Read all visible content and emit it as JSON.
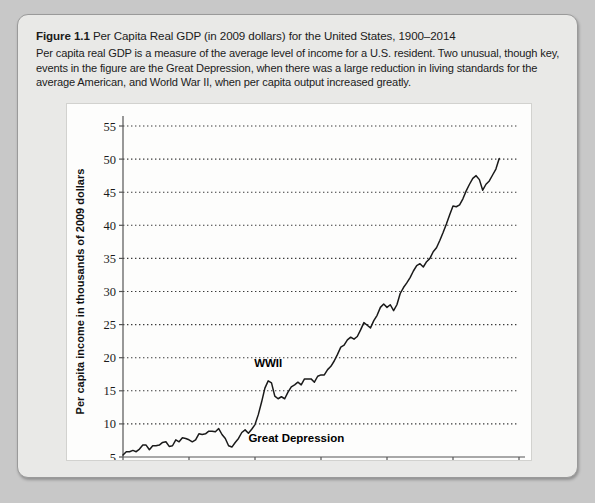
{
  "figure": {
    "label": "Figure 1.1",
    "title": "Per Capita Real GDP (in 2009 dollars) for the United States, 1900–2014",
    "description": "Per capita real GDP is a measure of the average level of income for a U.S. resident. Two unusual, though key, events in the figure are the Great Depression, when there was a large reduction in living standards for the average American, and World War II, when per capita output increased greatly."
  },
  "colors": {
    "page_background": "#c8c8c8",
    "panel_background": "#e9e9e7",
    "panel_border": "#9a9a9a",
    "plot_background": "#fdfdfc",
    "line": "#1a1a1a",
    "gridline": "#3a3a3a",
    "axis": "#555555"
  },
  "chart_data": {
    "type": "line",
    "title": "Per Capita Real GDP (in 2009 dollars) for the United States, 1900–2014",
    "xlabel": "Year",
    "ylabel": "Per capita income in thousands of 2009 dollars",
    "xlim": [
      1900,
      2020
    ],
    "ylim": [
      5,
      55
    ],
    "xticks": [
      1900,
      1920,
      1940,
      1960,
      1980,
      2000,
      2020
    ],
    "yticks": [
      5,
      10,
      15,
      20,
      25,
      30,
      35,
      40,
      45,
      50,
      55
    ],
    "grid": "horizontal-dotted",
    "legend": "none",
    "annotations": [
      {
        "text": "WWII",
        "x": 1944,
        "y": 18.6
      },
      {
        "text": "Great Depression",
        "x": 1938,
        "y": 7.2
      }
    ],
    "series": [
      {
        "name": "Per capita real GDP",
        "x": [
          1900,
          1901,
          1902,
          1903,
          1904,
          1905,
          1906,
          1907,
          1908,
          1909,
          1910,
          1911,
          1912,
          1913,
          1914,
          1915,
          1916,
          1917,
          1918,
          1919,
          1920,
          1921,
          1922,
          1923,
          1924,
          1925,
          1926,
          1927,
          1928,
          1929,
          1930,
          1931,
          1932,
          1933,
          1934,
          1935,
          1936,
          1937,
          1938,
          1939,
          1940,
          1941,
          1942,
          1943,
          1944,
          1945,
          1946,
          1947,
          1948,
          1949,
          1950,
          1951,
          1952,
          1953,
          1954,
          1955,
          1956,
          1957,
          1958,
          1959,
          1960,
          1961,
          1962,
          1963,
          1964,
          1965,
          1966,
          1967,
          1968,
          1969,
          1970,
          1971,
          1972,
          1973,
          1974,
          1975,
          1976,
          1977,
          1978,
          1979,
          1980,
          1981,
          1982,
          1983,
          1984,
          1985,
          1986,
          1987,
          1988,
          1989,
          1990,
          1991,
          1992,
          1993,
          1994,
          1995,
          1996,
          1997,
          1998,
          1999,
          2000,
          2001,
          2002,
          2003,
          2004,
          2005,
          2006,
          2007,
          2008,
          2009,
          2010,
          2011,
          2012,
          2013,
          2014
        ],
        "y": [
          5.3,
          5.8,
          5.8,
          6.0,
          5.8,
          6.2,
          6.8,
          6.8,
          6.1,
          6.7,
          6.7,
          6.8,
          7.2,
          7.3,
          6.6,
          6.7,
          7.6,
          7.3,
          7.9,
          7.8,
          7.6,
          7.3,
          7.6,
          8.5,
          8.4,
          8.5,
          8.9,
          8.9,
          8.8,
          9.3,
          8.4,
          7.8,
          6.7,
          6.5,
          7.2,
          7.8,
          8.7,
          9.1,
          8.6,
          9.2,
          9.9,
          11.4,
          13.3,
          15.4,
          16.5,
          16.2,
          14.2,
          13.8,
          14.1,
          13.8,
          14.8,
          15.6,
          15.9,
          16.3,
          15.9,
          16.8,
          16.8,
          16.8,
          16.3,
          17.2,
          17.4,
          17.4,
          18.2,
          18.7,
          19.5,
          20.5,
          21.6,
          21.9,
          22.7,
          23.1,
          22.8,
          23.2,
          24.2,
          25.3,
          24.9,
          24.5,
          25.6,
          26.4,
          27.6,
          28.1,
          27.6,
          28.0,
          27.1,
          28.0,
          29.7,
          30.6,
          31.3,
          32.1,
          33.1,
          33.9,
          34.2,
          33.7,
          34.5,
          35.0,
          36.0,
          36.6,
          37.7,
          38.9,
          40.2,
          41.6,
          42.9,
          42.8,
          43.1,
          44.0,
          45.2,
          46.2,
          47.1,
          47.5,
          46.9,
          45.3,
          46.2,
          46.7,
          47.6,
          48.5,
          50.1
        ]
      }
    ]
  }
}
